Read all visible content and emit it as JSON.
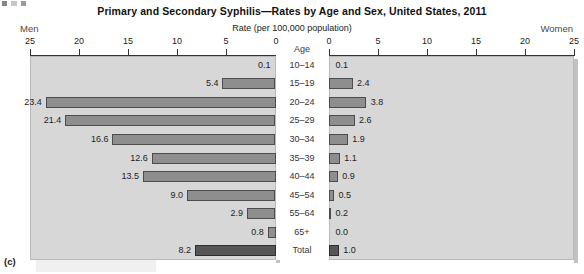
{
  "figure": {
    "letter": "(c)",
    "title": "Primary and Secondary Syphilis—Rates by Age and Sex, United States, 2011",
    "axis_title": "Rate (per 100,000 population)",
    "left_side_label": "Men",
    "right_side_label": "Women",
    "age_header": "Age"
  },
  "colors": {
    "panel_background": "#d7d7d7",
    "bar_fill": "#8e8e8e",
    "bar_border": "#4c4c4c",
    "total_bar_fill": "#565656",
    "total_bar_border": "#2e2e2e",
    "axis": "#333333",
    "text": "#1d1d1d"
  },
  "chart_data": {
    "type": "bar",
    "title": "Primary and Secondary Syphilis—Rates by Age and Sex, United States, 2011",
    "subtitle": "",
    "orientation": "horizontal",
    "layout": "population-pyramid",
    "xlabel": "Rate (per 100,000 population)",
    "ylabel": "Age",
    "grid": false,
    "legend_position": "none",
    "categories": [
      "10–14",
      "15–19",
      "20–24",
      "25–29",
      "30–34",
      "35–39",
      "40–44",
      "45–54",
      "55–64",
      "65+",
      "Total"
    ],
    "left_axis": {
      "name": "Men",
      "direction": "left",
      "ticks": [
        25,
        20,
        15,
        10,
        5,
        0
      ],
      "xlim": [
        0,
        25
      ]
    },
    "right_axis": {
      "name": "Women",
      "direction": "right",
      "ticks": [
        0,
        5,
        10,
        15,
        20,
        25
      ],
      "xlim": [
        0,
        25
      ]
    },
    "series": [
      {
        "name": "Men",
        "side": "left",
        "values": [
          0.1,
          5.4,
          23.4,
          21.4,
          16.6,
          12.6,
          13.5,
          9.0,
          2.9,
          0.8,
          8.2
        ],
        "labels": [
          "0.1",
          "5.4",
          "23.4",
          "21.4",
          "16.6",
          "12.6",
          "13.5",
          "9.0",
          "2.9",
          "0.8",
          "8.2"
        ]
      },
      {
        "name": "Women",
        "side": "right",
        "values": [
          0.1,
          2.4,
          3.8,
          2.6,
          1.9,
          1.1,
          0.9,
          0.5,
          0.2,
          0.0,
          1.0
        ],
        "labels": [
          "0.1",
          "2.4",
          "3.8",
          "2.6",
          "1.9",
          "1.1",
          "0.9",
          "0.5",
          "0.2",
          "0.0",
          "1.0"
        ]
      }
    ]
  }
}
